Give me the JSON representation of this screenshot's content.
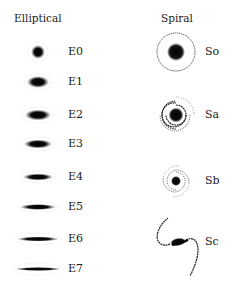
{
  "headings": {
    "elliptical": "Elliptical",
    "spiral": "Spiral"
  },
  "elliptical": [
    {
      "label": "E0",
      "y": 52,
      "rx": 7,
      "ry": 7
    },
    {
      "label": "E1",
      "y": 82,
      "rx": 11,
      "ry": 6
    },
    {
      "label": "E2",
      "y": 115,
      "rx": 13,
      "ry": 5.5
    },
    {
      "label": "E3",
      "y": 144,
      "rx": 14,
      "ry": 4.5
    },
    {
      "label": "E4",
      "y": 177,
      "rx": 15,
      "ry": 3.5
    },
    {
      "label": "E5",
      "y": 207,
      "rx": 18,
      "ry": 3
    },
    {
      "label": "E6",
      "y": 239,
      "rx": 21,
      "ry": 2.5
    },
    {
      "label": "E7",
      "y": 269,
      "rx": 23,
      "ry": 2
    }
  ],
  "spiral": [
    {
      "label": "So",
      "y": 52
    },
    {
      "label": "Sa",
      "y": 115
    },
    {
      "label": "Sb",
      "y": 181
    },
    {
      "label": "Sc",
      "y": 242
    }
  ]
}
